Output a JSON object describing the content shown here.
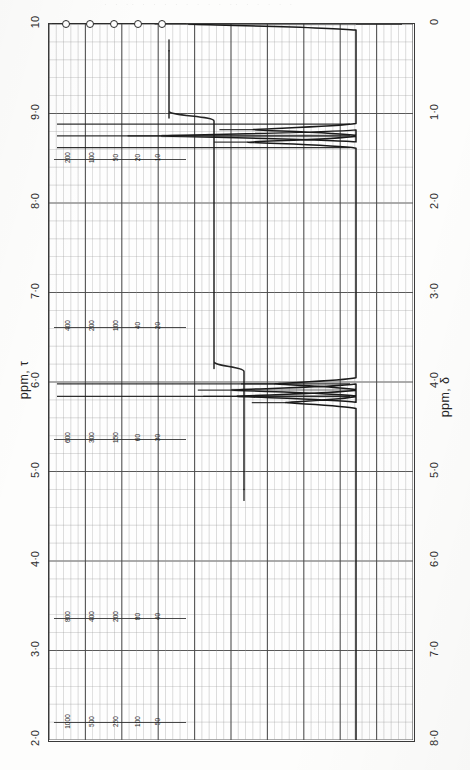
{
  "page": {
    "bleed_text": "· ·   ·· ·   ·  ·   · · ·  ·   ·  ·· ·  ·    ·  ·  ·",
    "background": "#fdfdfc",
    "trace_color": "#1a1a1a",
    "grid_major_color": "#4a4a4a",
    "grid_minor_color": "#9a9a9a"
  },
  "axes": {
    "left": {
      "title": "ppm, τ",
      "ticks": [
        "10",
        "9·0",
        "8·0",
        "7·0",
        "6·0",
        "5·0",
        "4·0",
        "3·0",
        "2·0"
      ],
      "values": [
        10,
        9,
        8,
        7,
        6,
        5,
        4,
        3,
        2
      ]
    },
    "right": {
      "title": "ppm, δ",
      "ticks": [
        "0",
        "1·0",
        "2·0",
        "3·0",
        "4·0",
        "5·0",
        "6·0",
        "7·0",
        "8·0"
      ],
      "values": [
        0,
        1,
        2,
        3,
        4,
        5,
        6,
        7,
        8
      ]
    }
  },
  "calibration_rows": [
    {
      "row": 1,
      "tau": 8.48,
      "labels": [
        "200",
        "100",
        "50",
        "20",
        "10"
      ]
    },
    {
      "row": 2,
      "tau": 6.6,
      "labels": [
        "400",
        "200",
        "100",
        "40",
        "20"
      ]
    },
    {
      "row": 3,
      "tau": 5.35,
      "labels": [
        "600",
        "300",
        "150",
        "60",
        "30"
      ]
    },
    {
      "row": 4,
      "tau": 3.35,
      "labels": [
        "800",
        "400",
        "200",
        "80",
        "40"
      ]
    },
    {
      "row": 5,
      "tau": 2.18,
      "labels": [
        "1000",
        "500",
        "250",
        "100",
        "50"
      ]
    }
  ],
  "ring_marker_row": {
    "tau": 10.0,
    "count": 5,
    "label": "calibration-rings"
  },
  "chart_data": {
    "type": "line",
    "title": "",
    "xlabel": "ppm, δ",
    "ylabel": "",
    "orientation": "vertical-rotated",
    "xlim": [
      0,
      8
    ],
    "tau_lim": [
      10,
      2
    ],
    "grid": true,
    "legend": false,
    "baseline_delta": 8.0,
    "series": [
      {
        "name": "1H NMR spectrum",
        "peaks": [
          {
            "delta": 0.0,
            "tau": 10.0,
            "height": 0.62,
            "assignment": "TMS reference",
            "multiplicity": "s"
          },
          {
            "delta": 1.18,
            "tau": 8.82,
            "height": 0.38,
            "assignment": "CH3 (triplet)",
            "multiplicity": "t"
          },
          {
            "delta": 1.25,
            "tau": 8.75,
            "height": 0.72,
            "assignment": "CH3 (triplet)",
            "multiplicity": "t"
          },
          {
            "delta": 1.32,
            "tau": 8.68,
            "height": 0.4,
            "assignment": "CH3 (triplet)",
            "multiplicity": "t"
          },
          {
            "delta": 4.02,
            "tau": 5.98,
            "height": 0.3,
            "assignment": "OCH2 (quartet)",
            "multiplicity": "q"
          },
          {
            "delta": 4.09,
            "tau": 5.91,
            "height": 0.46,
            "assignment": "OCH2 (quartet)",
            "multiplicity": "q"
          },
          {
            "delta": 4.16,
            "tau": 5.84,
            "height": 0.44,
            "assignment": "OCH2 (quartet)",
            "multiplicity": "q"
          },
          {
            "delta": 4.23,
            "tau": 5.77,
            "height": 0.26,
            "assignment": "OCH2 (quartet)",
            "multiplicity": "q"
          }
        ]
      },
      {
        "name": "integral trace",
        "steps": [
          {
            "delta_start": 0.3,
            "delta_end": 1.05,
            "level": 0.0
          },
          {
            "delta_start": 1.05,
            "delta_end": 1.45,
            "level": 0.3,
            "rise": 0.3
          },
          {
            "delta_start": 1.45,
            "delta_end": 3.85,
            "level": 0.3
          },
          {
            "delta_start": 3.85,
            "delta_end": 4.35,
            "level": 0.5,
            "rise": 0.2
          },
          {
            "delta_start": 4.35,
            "delta_end": 5.2,
            "level": 0.5
          }
        ]
      }
    ]
  }
}
